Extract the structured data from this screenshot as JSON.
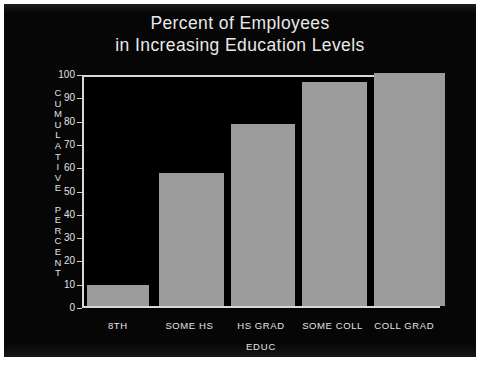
{
  "chart_data": {
    "type": "bar",
    "title": "Percent of Employees\nin Increasing Education Levels",
    "title_line1": "Percent of Employees",
    "title_line2": "in Increasing Education Levels",
    "categories": [
      "8TH",
      "SOME HS",
      "HS GRAD",
      "SOME COLL",
      "COLL GRAD"
    ],
    "values": [
      9,
      57,
      78,
      96,
      100
    ],
    "xlabel": "EDUC",
    "ylabel": "CUMULATIVE PERCENT",
    "ylabel_stacked": "C\nU\nM\nU\nL\nA\nT\nI\nV\nE\n\nP\nE\nR\nC\nE\nN\nT",
    "ylim": [
      0,
      100
    ],
    "yticks": [
      100,
      90,
      80,
      70,
      60,
      50,
      40,
      30,
      20,
      10,
      0
    ],
    "ytick_labels": [
      "100",
      "90",
      "80",
      "70",
      "60",
      "50",
      "40",
      "30",
      "20",
      "10",
      "0"
    ],
    "grid": false,
    "legend": null,
    "colors": {
      "background": "#060606",
      "bar": "#9b9b9b",
      "axis": "#d8d8d8",
      "text": "#e6e6e6"
    }
  }
}
